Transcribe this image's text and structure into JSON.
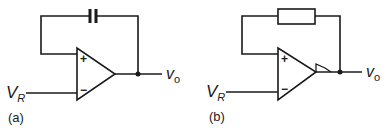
{
  "figure": {
    "panels": [
      {
        "tag": "(a)",
        "feedback_component": "capacitor",
        "input_label": {
          "main": "V",
          "sub": "R"
        },
        "output_label": {
          "main": "v",
          "sub": "o"
        },
        "plus_sign": "+",
        "minus_sign": "−"
      },
      {
        "tag": "(b)",
        "feedback_component": "resistor",
        "amplifier_marking": "hysteresis (Schmitt trigger) symbol",
        "input_label": {
          "main": "V",
          "sub": "R"
        },
        "output_label": {
          "main": "v",
          "sub": "o"
        },
        "plus_sign": "+",
        "minus_sign": "−"
      }
    ],
    "colors": {
      "line": "#1a1a1a",
      "background": "#ffffff"
    }
  }
}
